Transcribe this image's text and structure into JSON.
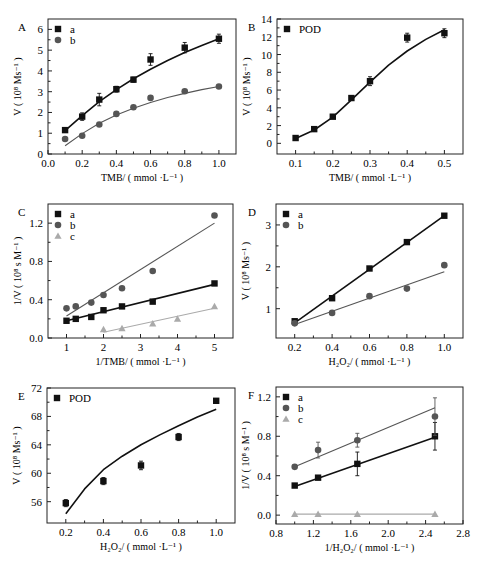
{
  "chart_data": [
    {
      "panel": "A",
      "type": "scatter",
      "title": "",
      "xlabel": "TMB/ ( mmol ·L⁻¹ )",
      "ylabel": "V ( 10⁸ Ms⁻¹ )",
      "xlim": [
        0.0,
        1.1
      ],
      "ylim": [
        0,
        6.5
      ],
      "xticks": [
        0.0,
        0.2,
        0.4,
        0.6,
        0.8,
        1.0
      ],
      "xtick_labels": [
        "0.0",
        "0.2",
        "0.4",
        "0.6",
        "0.8",
        "1.0"
      ],
      "yticks": [
        0,
        1,
        2,
        3,
        4,
        5,
        6
      ],
      "ytick_labels": [
        "0",
        "1",
        "2",
        "3",
        "4",
        "5",
        "6"
      ],
      "legend_position": "upper left",
      "grid": false,
      "series": [
        {
          "name": "a",
          "marker": "square",
          "color": "#111111",
          "x": [
            0.1,
            0.2,
            0.3,
            0.4,
            0.5,
            0.6,
            0.8,
            1.0
          ],
          "y": [
            1.15,
            1.8,
            2.62,
            3.12,
            3.58,
            4.55,
            5.12,
            5.55
          ],
          "err": [
            0.08,
            0.18,
            0.3,
            0.14,
            0.12,
            0.28,
            0.25,
            0.22
          ],
          "fit": {
            "x": [
              0.1,
              0.2,
              0.3,
              0.4,
              0.5,
              0.6,
              0.7,
              0.8,
              0.9,
              1.0
            ],
            "y": [
              1.12,
              1.85,
              2.52,
              3.1,
              3.62,
              4.08,
              4.5,
              4.88,
              5.23,
              5.55
            ]
          }
        },
        {
          "name": "b",
          "marker": "circle",
          "color": "#555555",
          "x": [
            0.1,
            0.2,
            0.3,
            0.4,
            0.5,
            0.6,
            0.8,
            1.0
          ],
          "y": [
            0.72,
            0.88,
            1.42,
            1.93,
            2.25,
            2.7,
            3.02,
            3.25
          ],
          "err": [
            0.05,
            0.05,
            0.05,
            0.05,
            0.05,
            0.05,
            0.05,
            0.05
          ],
          "fit": {
            "x": [
              0.1,
              0.2,
              0.3,
              0.4,
              0.5,
              0.6,
              0.7,
              0.8,
              0.9,
              1.0
            ],
            "y": [
              0.4,
              0.98,
              1.48,
              1.88,
              2.2,
              2.48,
              2.72,
              2.92,
              3.1,
              3.25
            ]
          }
        }
      ]
    },
    {
      "panel": "B",
      "type": "scatter",
      "title": "",
      "xlabel": "TMB/ ( mmol ·L⁻¹ )",
      "ylabel": "V ( 10⁸ Ms⁻¹ )",
      "xlim": [
        0.05,
        0.55
      ],
      "ylim": [
        -1.2,
        14
      ],
      "xticks": [
        0.1,
        0.2,
        0.3,
        0.4,
        0.5
      ],
      "xtick_labels": [
        "0.1",
        "0.2",
        "0.3",
        "0.4",
        "0.5"
      ],
      "yticks": [
        0,
        2,
        4,
        6,
        8,
        10,
        12,
        14
      ],
      "ytick_labels": [
        "0",
        "2",
        "4",
        "6",
        "8",
        "10",
        "12",
        "14"
      ],
      "legend_position": "upper left",
      "grid": false,
      "series": [
        {
          "name": "POD",
          "marker": "square",
          "color": "#111111",
          "x": [
            0.1,
            0.15,
            0.2,
            0.25,
            0.3,
            0.4,
            0.5
          ],
          "y": [
            0.6,
            1.6,
            3.0,
            5.1,
            7.0,
            11.9,
            12.4
          ],
          "err": [
            0.1,
            0.15,
            0.15,
            0.25,
            0.5,
            0.5,
            0.5
          ],
          "fit": {
            "x": [
              0.1,
              0.15,
              0.2,
              0.25,
              0.3,
              0.35,
              0.4,
              0.45,
              0.5
            ],
            "y": [
              0.55,
              1.5,
              2.95,
              4.9,
              6.9,
              8.8,
              10.4,
              11.7,
              12.8
            ]
          }
        }
      ]
    },
    {
      "panel": "C",
      "type": "scatter",
      "title": "",
      "xlabel": "1/TMB/ ( mmol ·L⁻¹ )",
      "ylabel": "1/V ( 10⁸ s M⁻¹ )",
      "xlim": [
        0.5,
        5.5
      ],
      "ylim": [
        0.0,
        1.4
      ],
      "xticks": [
        1,
        2,
        3,
        4,
        5
      ],
      "xtick_labels": [
        "1",
        "2",
        "3",
        "4",
        "5"
      ],
      "yticks": [
        0.0,
        0.4,
        0.8,
        1.2
      ],
      "ytick_labels": [
        "0.0",
        "0.4",
        "0.8",
        "1.2"
      ],
      "legend_position": "upper left",
      "grid": false,
      "series": [
        {
          "name": "a",
          "marker": "square",
          "color": "#111111",
          "x": [
            1,
            1.25,
            1.67,
            2,
            2.5,
            3.33,
            5
          ],
          "y": [
            0.18,
            0.2,
            0.22,
            0.29,
            0.33,
            0.38,
            0.57
          ],
          "fit": {
            "x": [
              1,
              5
            ],
            "y": [
              0.18,
              0.56
            ]
          }
        },
        {
          "name": "b",
          "marker": "circle",
          "color": "#555555",
          "x": [
            1,
            1.25,
            1.67,
            2,
            2.5,
            3.33,
            5
          ],
          "y": [
            0.31,
            0.33,
            0.37,
            0.45,
            0.52,
            0.7,
            1.28
          ],
          "fit": {
            "x": [
              1,
              5
            ],
            "y": [
              0.23,
              1.2
            ]
          }
        },
        {
          "name": "c",
          "marker": "triangle",
          "color": "#aaaaaa",
          "x": [
            2,
            2.5,
            3.33,
            4,
            5
          ],
          "y": [
            0.09,
            0.1,
            0.15,
            0.2,
            0.33
          ],
          "fit": {
            "x": [
              2,
              5
            ],
            "y": [
              0.06,
              0.31
            ]
          }
        }
      ]
    },
    {
      "panel": "D",
      "type": "scatter",
      "title": "",
      "xlabel": "H₂O₂/ ( mmol ·L⁻¹ )",
      "ylabel": "V ( 10⁸ Ms⁻¹ )",
      "xlim": [
        0.1,
        1.1
      ],
      "ylim": [
        0.3,
        3.5
      ],
      "xticks": [
        0.2,
        0.4,
        0.6,
        0.8,
        1.0
      ],
      "xtick_labels": [
        "0.2",
        "0.4",
        "0.6",
        "0.8",
        "1.0"
      ],
      "yticks": [
        1,
        2,
        3
      ],
      "ytick_labels": [
        "1",
        "2",
        "3"
      ],
      "legend_position": "upper left",
      "grid": false,
      "series": [
        {
          "name": "a",
          "marker": "square",
          "color": "#111111",
          "x": [
            0.2,
            0.4,
            0.6,
            0.8,
            1.0
          ],
          "y": [
            0.7,
            1.25,
            1.96,
            2.59,
            3.22
          ],
          "fit": {
            "x": [
              0.2,
              1.0
            ],
            "y": [
              0.66,
              3.22
            ]
          }
        },
        {
          "name": "b",
          "marker": "circle",
          "color": "#555555",
          "x": [
            0.2,
            0.4,
            0.6,
            0.8,
            1.0
          ],
          "y": [
            0.65,
            0.9,
            1.3,
            1.48,
            2.04
          ],
          "fit": {
            "x": [
              0.2,
              1.0
            ],
            "y": [
              0.62,
              1.88
            ]
          }
        }
      ]
    },
    {
      "panel": "E",
      "type": "scatter",
      "title": "",
      "xlabel": "H₂O₂/ ( mmol ·L⁻¹ )",
      "ylabel": "V ( 10⁸ Ms⁻¹ )",
      "xlim": [
        0.1,
        1.1
      ],
      "ylim": [
        53,
        72
      ],
      "xticks": [
        0.2,
        0.4,
        0.6,
        0.8,
        1.0
      ],
      "xtick_labels": [
        "0.2",
        "0.4",
        "0.6",
        "0.8",
        "1.0"
      ],
      "yticks": [
        56,
        60,
        64,
        68,
        72
      ],
      "ytick_labels": [
        "56",
        "60",
        "64",
        "68",
        "72"
      ],
      "legend_position": "upper left",
      "grid": false,
      "series": [
        {
          "name": "POD",
          "marker": "square",
          "color": "#111111",
          "x": [
            0.2,
            0.4,
            0.6,
            0.8,
            1.0
          ],
          "y": [
            55.8,
            58.9,
            61.1,
            65.1,
            70.2
          ],
          "err": [
            0.5,
            0.5,
            0.6,
            0.5,
            0.3
          ],
          "fit": {
            "x": [
              0.2,
              0.3,
              0.4,
              0.5,
              0.6,
              0.7,
              0.8,
              0.9,
              1.0
            ],
            "y": [
              54.3,
              57.8,
              60.5,
              62.4,
              64.0,
              65.4,
              66.7,
              67.9,
              69.0
            ]
          }
        }
      ]
    },
    {
      "panel": "F",
      "type": "scatter",
      "title": "",
      "xlabel": "1/H₂O₂/ ( mmol ·L⁻¹ )",
      "ylabel": "1/V ( 10⁸ s M⁻¹ )",
      "xlim": [
        0.8,
        2.8
      ],
      "ylim": [
        -0.09,
        1.3
      ],
      "xticks": [
        0.8,
        1.2,
        1.6,
        2.0,
        2.4,
        2.8
      ],
      "xtick_labels": [
        "0.8",
        "1.2",
        "1.6",
        "2.0",
        "2.4",
        "2.8"
      ],
      "yticks": [
        0.0,
        0.4,
        0.8,
        1.2
      ],
      "ytick_labels": [
        "0.0",
        "0.4",
        "0.8",
        "1.2"
      ],
      "legend_position": "upper left",
      "grid": false,
      "series": [
        {
          "name": "a",
          "marker": "square",
          "color": "#111111",
          "x": [
            1.0,
            1.25,
            1.67,
            2.5
          ],
          "y": [
            0.3,
            0.38,
            0.52,
            0.8
          ],
          "err": [
            0.02,
            0.02,
            0.12,
            0.14
          ],
          "fit": {
            "x": [
              1.0,
              2.5
            ],
            "y": [
              0.29,
              0.79
            ]
          }
        },
        {
          "name": "b",
          "marker": "circle",
          "color": "#555555",
          "x": [
            1.0,
            1.25,
            1.67,
            2.5
          ],
          "y": [
            0.49,
            0.66,
            0.76,
            1.0
          ],
          "err": [
            0.02,
            0.08,
            0.07,
            0.19
          ],
          "fit": {
            "x": [
              1.0,
              2.5
            ],
            "y": [
              0.49,
              1.09
            ]
          }
        },
        {
          "name": "c",
          "marker": "triangle",
          "color": "#aaaaaa",
          "x": [
            1.0,
            1.25,
            1.67,
            2.5
          ],
          "y": [
            0.01,
            0.01,
            0.01,
            0.01
          ],
          "fit": {
            "x": [
              1.0,
              2.5
            ],
            "y": [
              0.01,
              0.01
            ]
          }
        }
      ]
    }
  ],
  "layout": {
    "panels": [
      {
        "box": [
          48,
          19,
          236,
          154
        ],
        "label_pos": [
          18,
          31
        ]
      },
      {
        "box": [
          277,
          19,
          463,
          154
        ],
        "label_pos": [
          248,
          31
        ]
      },
      {
        "box": [
          48,
          204,
          233,
          338
        ],
        "label_pos": [
          18,
          216
        ]
      },
      {
        "box": [
          276,
          204,
          463,
          338
        ],
        "label_pos": [
          248,
          216
        ]
      },
      {
        "box": [
          47,
          388,
          235,
          523
        ],
        "label_pos": [
          18,
          400
        ]
      },
      {
        "box": [
          276,
          387,
          463,
          524
        ],
        "label_pos": [
          248,
          399
        ]
      }
    ]
  }
}
